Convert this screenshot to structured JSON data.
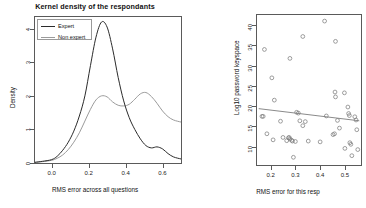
{
  "left_panel": {
    "title": "Kernel density of the respondants",
    "legend": {
      "items": [
        {
          "label": "Expert",
          "color": "#2b2b2b"
        },
        {
          "label": "Non expert",
          "color": "#9b9b9b"
        }
      ]
    }
  },
  "right_panel": {},
  "chart_data": [
    {
      "type": "line",
      "id": "kernel-density",
      "title": "Kernel density of the respondants",
      "xlabel": "RMS error across all questions",
      "ylabel": "Density",
      "xlim": [
        -0.09,
        0.7
      ],
      "ylim": [
        0,
        4.35
      ],
      "xticks": [
        "0.0",
        "0.2",
        "0.4",
        "0.6"
      ],
      "xtick_values": [
        0.0,
        0.2,
        0.4,
        0.6
      ],
      "yticks": [
        "0",
        "1",
        "2",
        "3",
        "4"
      ],
      "ytick_values": [
        0,
        1,
        2,
        3,
        4
      ],
      "grid": false,
      "legend_position": "top-left",
      "series": [
        {
          "name": "Expert",
          "color": "#2b2b2b",
          "x": [
            -0.09,
            -0.05,
            0.0,
            0.03,
            0.06,
            0.09,
            0.12,
            0.15,
            0.18,
            0.21,
            0.24,
            0.27,
            0.3,
            0.33,
            0.36,
            0.39,
            0.42,
            0.45,
            0.48,
            0.51,
            0.54,
            0.57,
            0.6,
            0.63,
            0.66,
            0.7
          ],
          "y": [
            0.02,
            0.05,
            0.1,
            0.2,
            0.38,
            0.62,
            0.95,
            1.4,
            2.0,
            2.9,
            3.75,
            4.2,
            4.05,
            3.4,
            2.55,
            1.85,
            1.35,
            1.0,
            0.72,
            0.52,
            0.45,
            0.48,
            0.42,
            0.28,
            0.18,
            0.12
          ]
        },
        {
          "name": "Non expert",
          "color": "#9b9b9b",
          "x": [
            -0.09,
            -0.05,
            0.0,
            0.03,
            0.06,
            0.09,
            0.12,
            0.15,
            0.18,
            0.21,
            0.24,
            0.27,
            0.3,
            0.33,
            0.36,
            0.39,
            0.42,
            0.45,
            0.48,
            0.51,
            0.54,
            0.57,
            0.6,
            0.63,
            0.66,
            0.7
          ],
          "y": [
            0.02,
            0.04,
            0.08,
            0.14,
            0.24,
            0.4,
            0.62,
            0.9,
            1.25,
            1.6,
            1.88,
            2.0,
            1.97,
            1.82,
            1.72,
            1.7,
            1.75,
            1.9,
            2.06,
            2.1,
            1.98,
            1.78,
            1.55,
            1.38,
            1.28,
            1.22
          ]
        }
      ]
    },
    {
      "type": "scatter",
      "id": "keyspace-vs-rms",
      "title": "",
      "xlabel": "RMS error for this resp",
      "ylabel": "Log10 password keyspace",
      "xlim": [
        0.145,
        0.565
      ],
      "ylim": [
        5.5,
        42.5
      ],
      "xticks": [
        "0.2",
        "0.3",
        "0.4",
        "0.5"
      ],
      "xtick_values": [
        0.2,
        0.3,
        0.4,
        0.5
      ],
      "yticks": [
        "10",
        "15",
        "20",
        "25",
        "30",
        "35",
        "40"
      ],
      "ytick_values": [
        10,
        15,
        20,
        25,
        30,
        35,
        40
      ],
      "grid": false,
      "marker": "open-circle",
      "marker_color": "#7d7d7d",
      "points": [
        {
          "x": 0.175,
          "y": 34.0
        },
        {
          "x": 0.205,
          "y": 27.0
        },
        {
          "x": 0.215,
          "y": 21.5
        },
        {
          "x": 0.165,
          "y": 17.5
        },
        {
          "x": 0.17,
          "y": 17.5
        },
        {
          "x": 0.185,
          "y": 13.2
        },
        {
          "x": 0.21,
          "y": 11.7
        },
        {
          "x": 0.24,
          "y": 16.3
        },
        {
          "x": 0.25,
          "y": 12.3
        },
        {
          "x": 0.265,
          "y": 11.5
        },
        {
          "x": 0.272,
          "y": 12.2
        },
        {
          "x": 0.275,
          "y": 12.3
        },
        {
          "x": 0.278,
          "y": 11.9
        },
        {
          "x": 0.285,
          "y": 11.6
        },
        {
          "x": 0.288,
          "y": 11.4
        },
        {
          "x": 0.278,
          "y": 31.8
        },
        {
          "x": 0.292,
          "y": 7.4
        },
        {
          "x": 0.3,
          "y": 11.3
        },
        {
          "x": 0.305,
          "y": 18.5
        },
        {
          "x": 0.312,
          "y": 18.3
        },
        {
          "x": 0.318,
          "y": 16.4
        },
        {
          "x": 0.33,
          "y": 37.2
        },
        {
          "x": 0.33,
          "y": 15.2
        },
        {
          "x": 0.34,
          "y": 16.2
        },
        {
          "x": 0.352,
          "y": 11.4
        },
        {
          "x": 0.4,
          "y": 11.2
        },
        {
          "x": 0.418,
          "y": 41.0
        },
        {
          "x": 0.425,
          "y": 17.6
        },
        {
          "x": 0.452,
          "y": 13.0
        },
        {
          "x": 0.458,
          "y": 13.2
        },
        {
          "x": 0.462,
          "y": 36.0
        },
        {
          "x": 0.46,
          "y": 23.5
        },
        {
          "x": 0.462,
          "y": 22.3
        },
        {
          "x": 0.47,
          "y": 16.5
        },
        {
          "x": 0.478,
          "y": 14.6
        },
        {
          "x": 0.498,
          "y": 23.3
        },
        {
          "x": 0.5,
          "y": 9.6
        },
        {
          "x": 0.512,
          "y": 19.8
        },
        {
          "x": 0.515,
          "y": 18.2
        },
        {
          "x": 0.518,
          "y": 17.7
        },
        {
          "x": 0.52,
          "y": 11.0
        },
        {
          "x": 0.524,
          "y": 10.6
        },
        {
          "x": 0.528,
          "y": 7.8
        },
        {
          "x": 0.54,
          "y": 17.4
        },
        {
          "x": 0.545,
          "y": 16.6
        },
        {
          "x": 0.548,
          "y": 14.2
        },
        {
          "x": 0.552,
          "y": 9.3
        }
      ],
      "fit_line": {
        "name": "linear fit",
        "color": "#7d7d7d",
        "x": [
          0.152,
          0.558
        ],
        "y": [
          19.4,
          16.4
        ]
      }
    }
  ]
}
